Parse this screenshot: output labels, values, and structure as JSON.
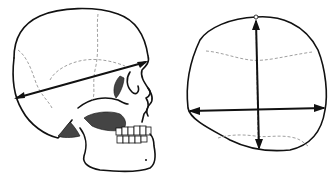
{
  "figure": {
    "panels": [
      {
        "id": "lateral-view",
        "label": "",
        "measurement": "glabella-opisthocranion length"
      },
      {
        "id": "superior-view",
        "label": "",
        "measurements": [
          "maximum cranial length",
          "maximum cranial breadth"
        ]
      }
    ],
    "colors": {
      "line": "#111111",
      "suture": "#888888",
      "shade": "#444444",
      "background": "#ffffff"
    }
  }
}
